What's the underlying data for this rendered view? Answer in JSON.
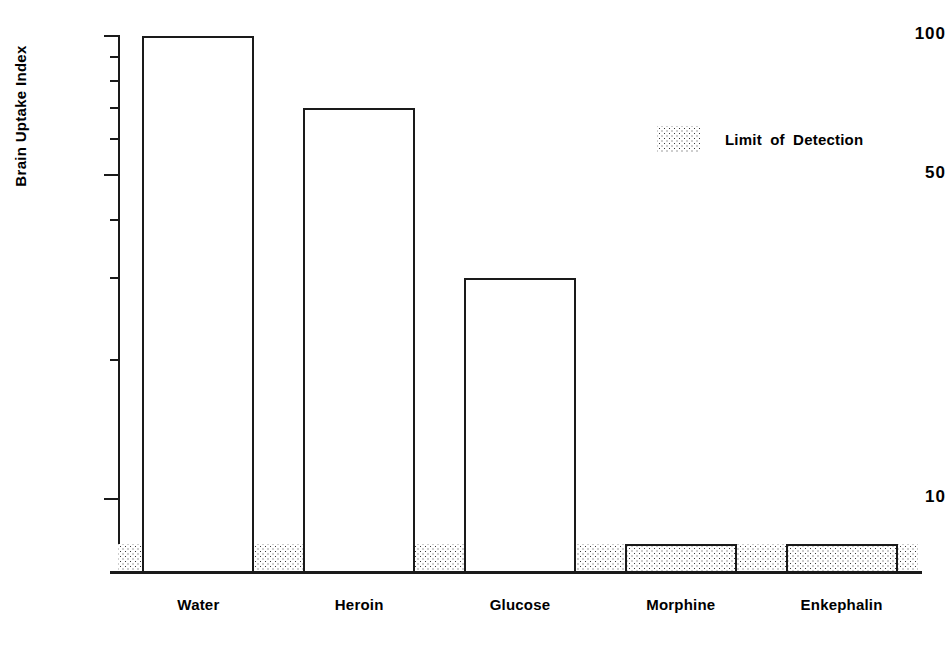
{
  "chart_data": {
    "type": "bar",
    "title": "",
    "subtitle": "",
    "xlabel": "",
    "ylabel": "Brain Uptake Index",
    "categories": [
      "Water",
      "Heroin",
      "Glucose",
      "Morphine",
      "Enkephalin"
    ],
    "values": [
      100,
      70,
      30,
      8,
      8
    ],
    "series": [
      {
        "name": "Brain Uptake Index",
        "values": [
          100,
          70,
          30,
          8,
          8
        ]
      }
    ],
    "yscale": "log",
    "ylim": [
      7,
      108
    ],
    "grid": false,
    "legend_position": "upper-right",
    "y_major_ticks": [
      100,
      50,
      10
    ],
    "y_major_tick_labels": [
      "100",
      "50",
      "10"
    ],
    "y_minor_ticks": [
      90,
      80,
      70,
      60,
      40,
      30,
      20
    ],
    "annotations": [
      {
        "name": "limit-of-detection-band",
        "label": "Limit of Detection",
        "value": 8,
        "kind": "horizontal-band",
        "band_range": [
          7,
          8
        ],
        "fill": "stipple"
      }
    ],
    "legend": [
      {
        "label": "Limit of Detection",
        "swatch": "stipple-pattern"
      }
    ]
  },
  "colors": {
    "ink": "#1a1a1a",
    "background": "#ffffff",
    "stipple_dot": "#3a3a3a"
  },
  "legend": {
    "label": "Limit of Detection"
  },
  "axis": {
    "y_label": "Brain Uptake Index",
    "ticks": [
      {
        "value": 100,
        "label": "100"
      },
      {
        "value": 50,
        "label": "50"
      },
      {
        "value": 10,
        "label": "10"
      }
    ]
  }
}
